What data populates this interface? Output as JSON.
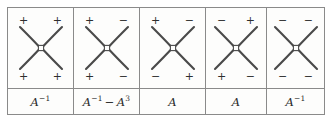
{
  "figure": {
    "kind": "crossing-coefficient-table",
    "columns": [
      {
        "signs": {
          "top_left": "+",
          "top_right": "+",
          "bottom_left": "+",
          "bottom_right": "+"
        },
        "coefficient": {
          "terms": [
            {
              "base": "A",
              "exponent": "−1"
            }
          ],
          "text": "A⁻¹"
        }
      },
      {
        "signs": {
          "top_left": "+",
          "top_right": "−",
          "bottom_left": "+",
          "bottom_right": "−"
        },
        "coefficient": {
          "terms": [
            {
              "base": "A",
              "exponent": "−1"
            },
            {
              "operator": "−",
              "base": "A",
              "exponent": "3"
            }
          ],
          "text": "A⁻¹ − A³"
        }
      },
      {
        "signs": {
          "top_left": "+",
          "top_right": "−",
          "bottom_left": "−",
          "bottom_right": "+"
        },
        "coefficient": {
          "terms": [
            {
              "base": "A",
              "exponent": ""
            }
          ],
          "text": "A"
        }
      },
      {
        "signs": {
          "top_left": "−",
          "top_right": "+",
          "bottom_left": "+",
          "bottom_right": "−"
        },
        "coefficient": {
          "terms": [
            {
              "base": "A",
              "exponent": ""
            }
          ],
          "text": "A"
        }
      },
      {
        "signs": {
          "top_left": "−",
          "top_right": "−",
          "bottom_left": "−",
          "bottom_right": "−"
        },
        "coefficient": {
          "terms": [
            {
              "base": "A",
              "exponent": "−1"
            }
          ],
          "text": "A⁻¹"
        }
      }
    ],
    "colors": {
      "border": "#8a8a8a",
      "strand": "#4a4a4a",
      "text": "#2e2e2e",
      "background": "#fdfdfc"
    }
  }
}
